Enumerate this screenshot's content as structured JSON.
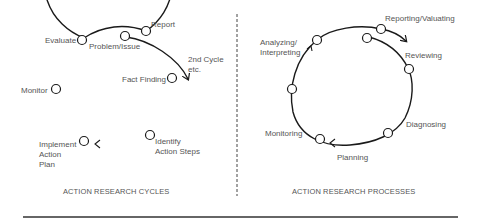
{
  "left_panel": {
    "caption": "ACTION RESEARCH CYCLES",
    "labels": {
      "report": "Report",
      "evaluate": "Evaluate",
      "problem": "Problem/Issue",
      "second_cycle_1": "2nd Cycle",
      "second_cycle_2": "etc.",
      "fact_finding": "Fact Finding",
      "monitor": "Monitor",
      "implement_1": "Implement",
      "implement_2": "Action",
      "implement_3": "Plan",
      "identify_1": "Identify",
      "identify_2": "Action Steps"
    }
  },
  "right_panel": {
    "caption": "ACTION RESEARCH PROCESSES",
    "labels": {
      "reporting": "Reporting/Valuating",
      "analyzing_1": "Analyzing/",
      "analyzing_2": "Interpreting",
      "reviewing": "Reviewing",
      "diagnosing": "Diagnosing",
      "monitoring": "Monitoring",
      "planning": "Planning"
    }
  },
  "colors": {
    "line": "#1a1a1a",
    "text": "#555555",
    "background": "#ffffff"
  }
}
